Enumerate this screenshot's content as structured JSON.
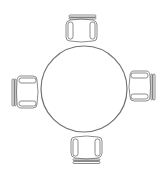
{
  "diagram": {
    "title": "",
    "stroke_color": "#6e6e6e",
    "table_stroke_color": "#707070",
    "background": "#ffffff",
    "table": {
      "shape": "circle",
      "cx": 84,
      "cy": 89,
      "r": 43
    },
    "chairs": [
      {
        "id": "top",
        "orientation": "facing-down",
        "x": 66,
        "y": 15,
        "w": 31,
        "h": 27
      },
      {
        "id": "left",
        "orientation": "facing-right",
        "x": 12,
        "y": 76,
        "w": 26,
        "h": 32
      },
      {
        "id": "right",
        "orientation": "facing-left",
        "x": 129,
        "y": 71,
        "w": 26,
        "h": 31
      },
      {
        "id": "bottom",
        "orientation": "facing-up",
        "x": 71,
        "y": 137,
        "w": 31,
        "h": 27
      }
    ]
  }
}
